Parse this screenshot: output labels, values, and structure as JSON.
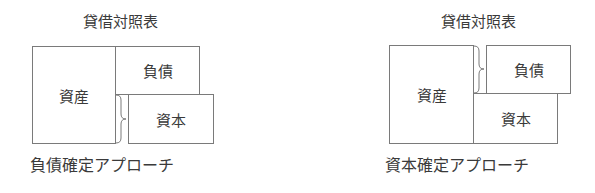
{
  "diagrams": [
    {
      "title": "貸借対照表",
      "assets_label": "資産",
      "liabilities_label": "負債",
      "equity_label": "資本",
      "caption": "負債確定アプローチ",
      "brace_on": "equity"
    },
    {
      "title": "貸借対照表",
      "assets_label": "資産",
      "liabilities_label": "負債",
      "equity_label": "資本",
      "caption": "資本確定アプローチ",
      "brace_on": "liabilities"
    }
  ]
}
